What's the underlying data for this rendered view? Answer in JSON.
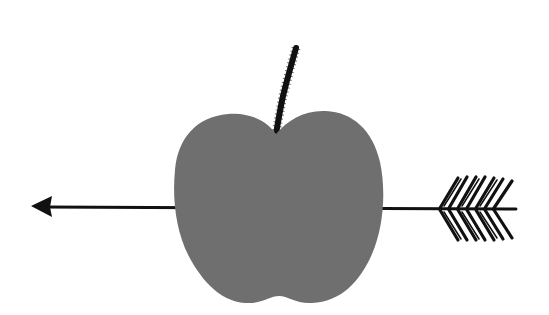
{
  "illustration": {
    "alt": "Gray apple pierced by an arrow",
    "subjects": [
      "apple",
      "stem",
      "arrow"
    ],
    "colors": {
      "background": "#ffffff",
      "apple": "#6f6f6f",
      "ink": "#111111"
    }
  }
}
